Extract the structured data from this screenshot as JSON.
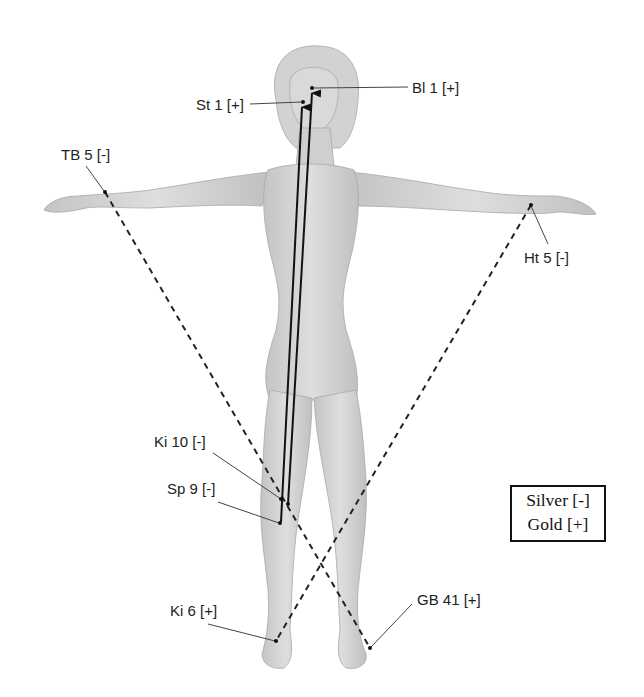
{
  "figure": {
    "points": [
      {
        "id": "st1",
        "label": "St 1 [+]",
        "x": 303,
        "y": 102,
        "label_x": 196,
        "label_y": 97
      },
      {
        "id": "bl1",
        "label": "Bl 1 [+]",
        "x": 312,
        "y": 88,
        "label_x": 412,
        "label_y": 82
      },
      {
        "id": "tb5",
        "label": "TB 5 [-]",
        "x": 105,
        "y": 192,
        "label_x": 61,
        "label_y": 148
      },
      {
        "id": "ht5",
        "label": "Ht 5 [-]",
        "x": 531,
        "y": 205,
        "label_x": 525,
        "label_y": 252
      },
      {
        "id": "ki10",
        "label": "Ki 10 [-]",
        "x": 281,
        "y": 499,
        "label_x": 154,
        "label_y": 435
      },
      {
        "id": "sp9",
        "label": "Sp 9 [-]",
        "x": 280,
        "y": 523,
        "label_x": 167,
        "label_y": 482
      },
      {
        "id": "ki6",
        "label": "Ki 6 [+]",
        "x": 276,
        "y": 641,
        "label_x": 170,
        "label_y": 604
      },
      {
        "id": "gb41",
        "label": "GB 41 [+]",
        "x": 370,
        "y": 648,
        "label_x": 417,
        "label_y": 593
      }
    ],
    "solid_arrows": [
      {
        "from": "ki10",
        "to": "st1"
      },
      {
        "from": "ki10b",
        "to": "bl1"
      }
    ],
    "dashed_lines": [
      {
        "from": "tb5",
        "to": "gb41"
      },
      {
        "from": "ht5",
        "to": "ki6"
      }
    ]
  },
  "legend": {
    "silver": "Silver [-]",
    "gold": "Gold [+]"
  },
  "colors": {
    "skin": "#d6d6d6",
    "skin_shadow": "#b9b9b9",
    "line": "#111111",
    "text": "#222222"
  }
}
